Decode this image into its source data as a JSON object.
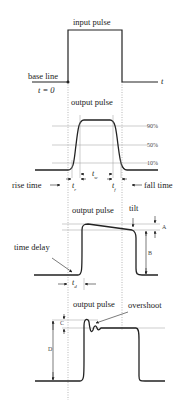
{
  "panel1": {
    "title": "input pulse",
    "baseline_label": "base line",
    "t0_label": "t = 0",
    "t_axis": "t"
  },
  "panel2": {
    "title": "output pulse",
    "levels": [
      "90%",
      "50%",
      "10%"
    ],
    "rise_label": "rise time",
    "fall_label": "fall time",
    "tr": "t",
    "tr_sub": "r",
    "tw": "t",
    "tw_sub": "w",
    "tf": "t",
    "tf_sub": "f"
  },
  "panel3": {
    "title": "output pulse",
    "tilt_label": "tilt",
    "delay_label": "time delay",
    "td": "t",
    "td_sub": "d",
    "A": "A",
    "B": "B"
  },
  "panel4": {
    "title": "output pulse",
    "overshoot_label": "overshoot",
    "C": "C",
    "D": "D"
  },
  "colors": {
    "line": "#222222",
    "guide": "#999999"
  }
}
